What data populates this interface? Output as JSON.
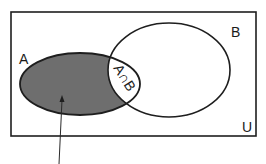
{
  "diagram": {
    "type": "venn",
    "universe_label": "U",
    "set_a_label": "A",
    "set_b_label": "B",
    "intersection_label": "A∩B",
    "shaded_region": "A only (A minus B)",
    "colors": {
      "shade": "#6e6e6e",
      "stroke": "#1e1e1e",
      "background": "#ffffff"
    }
  }
}
